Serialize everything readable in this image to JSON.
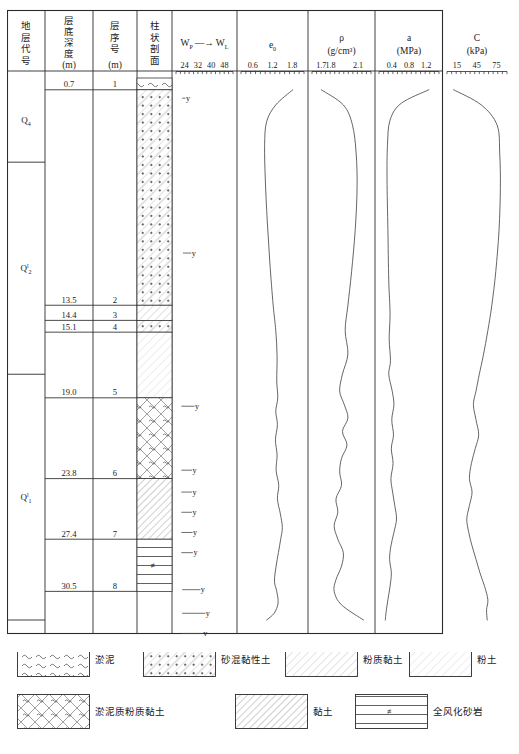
{
  "columns": {
    "strat_code": {
      "header_lines": [
        "地",
        "层",
        "代",
        "号"
      ]
    },
    "layer_depth": {
      "header_lines": [
        "层",
        "底",
        "深",
        "度"
      ],
      "unit": "(m)"
    },
    "layer_no": {
      "header_lines": [
        "层",
        "序",
        "号"
      ],
      "unit": "(m)"
    },
    "profile": {
      "header_lines": [
        "柱",
        "状",
        "剖",
        "面"
      ]
    },
    "wp_wl": {
      "symbol_left": "W",
      "sub_left": "P",
      "symbol_right": "W",
      "sub_right": "L",
      "ticks": [
        "24",
        "32",
        "40",
        "48"
      ],
      "tick_values": [
        24,
        32,
        40,
        48
      ]
    },
    "e0": {
      "symbol": "e",
      "sub": "0",
      "ticks": [
        "0.6",
        "1.2",
        "1.8"
      ],
      "tick_values": [
        0.6,
        1.2,
        1.8
      ]
    },
    "rho": {
      "symbol": "ρ",
      "unit": "(g/cm³)",
      "ticks": [
        "1.7",
        "1.8",
        "2.1"
      ],
      "tick_values": [
        1.7,
        1.8,
        2.1
      ]
    },
    "a": {
      "symbol": "a",
      "unit": "(MPa)",
      "ticks": [
        "0.4",
        "0.8",
        "1.2"
      ],
      "tick_values": [
        0.4,
        0.8,
        1.2
      ]
    },
    "C": {
      "symbol": "C",
      "unit": "(kPa)",
      "ticks": [
        "15",
        "45",
        "75"
      ],
      "tick_values": [
        15,
        45,
        75
      ]
    }
  },
  "strat_groups": [
    {
      "code": "Q",
      "sub": "4",
      "sup": "",
      "depth_top": 0.0,
      "depth_bottom": 5.0
    },
    {
      "code": "Q",
      "sub": "2",
      "sup": "l",
      "depth_top": 5.0,
      "depth_bottom": 17.6
    },
    {
      "code": "Q",
      "sub": "1",
      "sup": "l",
      "depth_top": 17.6,
      "depth_bottom": 32.2
    }
  ],
  "layers": [
    {
      "no": "1",
      "depth_bottom": "0.7",
      "depth_value": 0.7,
      "pattern": "mud"
    },
    {
      "no": "2",
      "depth_bottom": "13.5",
      "depth_value": 13.5,
      "pattern": "sand-clay"
    },
    {
      "no": "3",
      "depth_bottom": "14.4",
      "depth_value": 14.4,
      "pattern": "silty-clay"
    },
    {
      "no": "4",
      "depth_bottom": "15.1",
      "depth_value": 15.1,
      "pattern": "sand-clay"
    },
    {
      "no": "5",
      "depth_bottom": "19.0",
      "depth_value": 19.0,
      "pattern": "silt"
    },
    {
      "no": "6",
      "depth_bottom": "23.8",
      "depth_value": 23.8,
      "pattern": "muddy-silty-clay"
    },
    {
      "no": "7",
      "depth_bottom": "27.4",
      "depth_value": 27.4,
      "pattern": "clay"
    },
    {
      "no": "8",
      "depth_bottom": "30.5",
      "depth_value": 30.5,
      "pattern": "weathered-sandstone"
    }
  ],
  "chart_data": {
    "type": "line",
    "ylabel": "深度 (m)",
    "ylim": [
      0,
      32.2
    ],
    "grid": false,
    "legend": "none",
    "panels": [
      {
        "name": "wp_wl",
        "label": "W_P — W_L",
        "type": "range-bar",
        "xlim": [
          20,
          52
        ],
        "xticks": [
          24,
          32,
          40,
          48
        ],
        "points": [
          {
            "depth": 1.2,
            "wp": 22.5,
            "wl": 24.5
          },
          {
            "depth": 10.4,
            "wp": 23.0,
            "wl": 28.0
          },
          {
            "depth": 19.5,
            "wp": 22.0,
            "wl": 30.0
          },
          {
            "depth": 23.3,
            "wp": 22.0,
            "wl": 28.5
          },
          {
            "depth": 24.6,
            "wp": 22.0,
            "wl": 28.5
          },
          {
            "depth": 25.8,
            "wp": 22.0,
            "wl": 28.5
          },
          {
            "depth": 27.0,
            "wp": 22.0,
            "wl": 28.8
          },
          {
            "depth": 28.2,
            "wp": 22.0,
            "wl": 29.0
          },
          {
            "depth": 30.4,
            "wp": 22.5,
            "wl": 33.5
          },
          {
            "depth": 31.8,
            "wp": 22.5,
            "wl": 36.5
          },
          {
            "depth": 33.0,
            "wp": 22.5,
            "wl": 35.0
          },
          {
            "depth": 34.4,
            "wp": 22.5,
            "wl": 39.0
          },
          {
            "depth": 35.6,
            "wp": 23.5,
            "wl": 37.5
          },
          {
            "depth": 37.4,
            "wp": 25.5,
            "wl": 33.5
          },
          {
            "depth": 38.6,
            "wp": 21.5,
            "wl": 29.0
          },
          {
            "depth": 39.9,
            "wp": 26.0,
            "wl": 34.0
          },
          {
            "depth": 42.0,
            "wp": 20.5,
            "wl": 23.0
          }
        ]
      },
      {
        "name": "e0",
        "label": "e₀",
        "type": "line",
        "xlim": [
          0.3,
          2.1
        ],
        "xticks": [
          0.6,
          1.2,
          1.8
        ],
        "values": [
          {
            "depth": 0.7,
            "v": 1.82
          },
          {
            "depth": 1.6,
            "v": 1.3
          },
          {
            "depth": 2.6,
            "v": 1.02
          },
          {
            "depth": 4.0,
            "v": 0.96
          },
          {
            "depth": 6.0,
            "v": 0.98
          },
          {
            "depth": 8.5,
            "v": 1.04
          },
          {
            "depth": 11.0,
            "v": 1.12
          },
          {
            "depth": 13.5,
            "v": 1.22
          },
          {
            "depth": 15.0,
            "v": 1.3
          },
          {
            "depth": 16.5,
            "v": 1.34
          },
          {
            "depth": 18.0,
            "v": 1.33
          },
          {
            "depth": 19.0,
            "v": 1.36
          },
          {
            "depth": 19.8,
            "v": 1.3
          },
          {
            "depth": 20.6,
            "v": 1.35
          },
          {
            "depth": 21.5,
            "v": 1.29
          },
          {
            "depth": 22.4,
            "v": 1.34
          },
          {
            "depth": 23.3,
            "v": 1.31
          },
          {
            "depth": 24.2,
            "v": 1.39
          },
          {
            "depth": 25.0,
            "v": 1.35
          },
          {
            "depth": 25.9,
            "v": 1.44
          },
          {
            "depth": 26.7,
            "v": 1.5
          },
          {
            "depth": 27.4,
            "v": 1.45
          },
          {
            "depth": 28.2,
            "v": 1.38
          },
          {
            "depth": 29.0,
            "v": 1.31
          },
          {
            "depth": 29.9,
            "v": 1.26
          },
          {
            "depth": 30.5,
            "v": 1.33
          },
          {
            "depth": 31.2,
            "v": 1.37
          },
          {
            "depth": 31.8,
            "v": 1.25
          },
          {
            "depth": 32.2,
            "v": 1.02
          }
        ]
      },
      {
        "name": "rho",
        "label": "ρ (g/cm³)",
        "type": "line",
        "xlim": [
          1.62,
          2.22
        ],
        "xticks": [
          1.7,
          1.8,
          2.1
        ],
        "values": [
          {
            "depth": 0.7,
            "v": 1.7
          },
          {
            "depth": 1.6,
            "v": 1.94
          },
          {
            "depth": 2.8,
            "v": 2.04
          },
          {
            "depth": 4.5,
            "v": 2.08
          },
          {
            "depth": 6.5,
            "v": 2.09
          },
          {
            "depth": 9.0,
            "v": 2.07
          },
          {
            "depth": 11.5,
            "v": 2.03
          },
          {
            "depth": 13.5,
            "v": 1.99
          },
          {
            "depth": 15.0,
            "v": 1.96
          },
          {
            "depth": 16.4,
            "v": 1.99
          },
          {
            "depth": 17.6,
            "v": 1.93
          },
          {
            "depth": 18.6,
            "v": 1.9
          },
          {
            "depth": 19.4,
            "v": 1.95
          },
          {
            "depth": 20.2,
            "v": 1.99
          },
          {
            "depth": 21.0,
            "v": 1.93
          },
          {
            "depth": 21.8,
            "v": 1.98
          },
          {
            "depth": 22.6,
            "v": 1.92
          },
          {
            "depth": 23.4,
            "v": 1.9
          },
          {
            "depth": 24.2,
            "v": 1.92
          },
          {
            "depth": 25.0,
            "v": 1.86
          },
          {
            "depth": 25.8,
            "v": 1.88
          },
          {
            "depth": 26.6,
            "v": 1.84
          },
          {
            "depth": 27.4,
            "v": 1.88
          },
          {
            "depth": 28.2,
            "v": 1.94
          },
          {
            "depth": 29.0,
            "v": 1.92
          },
          {
            "depth": 29.8,
            "v": 1.86
          },
          {
            "depth": 30.5,
            "v": 1.84
          },
          {
            "depth": 31.3,
            "v": 1.92
          },
          {
            "depth": 32.2,
            "v": 2.16
          }
        ]
      },
      {
        "name": "a",
        "label": "a (MPa)",
        "type": "line",
        "xlim": [
          0.15,
          1.45
        ],
        "xticks": [
          0.4,
          0.8,
          1.2
        ],
        "values": [
          {
            "depth": 0.7,
            "v": 1.26
          },
          {
            "depth": 1.5,
            "v": 0.62
          },
          {
            "depth": 2.5,
            "v": 0.36
          },
          {
            "depth": 4.0,
            "v": 0.3
          },
          {
            "depth": 6.0,
            "v": 0.29
          },
          {
            "depth": 9.0,
            "v": 0.31
          },
          {
            "depth": 12.0,
            "v": 0.33
          },
          {
            "depth": 14.0,
            "v": 0.36
          },
          {
            "depth": 15.5,
            "v": 0.34
          },
          {
            "depth": 16.8,
            "v": 0.37
          },
          {
            "depth": 17.6,
            "v": 0.33
          },
          {
            "depth": 18.6,
            "v": 0.41
          },
          {
            "depth": 19.4,
            "v": 0.45
          },
          {
            "depth": 20.3,
            "v": 0.4
          },
          {
            "depth": 21.2,
            "v": 0.44
          },
          {
            "depth": 22.0,
            "v": 0.39
          },
          {
            "depth": 22.9,
            "v": 0.43
          },
          {
            "depth": 23.8,
            "v": 0.38
          },
          {
            "depth": 24.6,
            "v": 0.42
          },
          {
            "depth": 25.4,
            "v": 0.47
          },
          {
            "depth": 26.2,
            "v": 0.51
          },
          {
            "depth": 27.0,
            "v": 0.45
          },
          {
            "depth": 27.8,
            "v": 0.38
          },
          {
            "depth": 28.6,
            "v": 0.35
          },
          {
            "depth": 29.4,
            "v": 0.39
          },
          {
            "depth": 30.2,
            "v": 0.36
          },
          {
            "depth": 31.0,
            "v": 0.31
          },
          {
            "depth": 31.7,
            "v": 0.27
          },
          {
            "depth": 32.2,
            "v": 0.25
          }
        ]
      },
      {
        "name": "C",
        "label": "C (kPa)",
        "type": "line",
        "xlim": [
          3,
          88
        ],
        "xticks": [
          15,
          45,
          75
        ],
        "values": [
          {
            "depth": 0.7,
            "v": 10
          },
          {
            "depth": 1.6,
            "v": 52
          },
          {
            "depth": 2.8,
            "v": 76
          },
          {
            "depth": 4.5,
            "v": 80
          },
          {
            "depth": 6.5,
            "v": 81
          },
          {
            "depth": 9.0,
            "v": 79
          },
          {
            "depth": 11.5,
            "v": 74
          },
          {
            "depth": 13.5,
            "v": 68
          },
          {
            "depth": 15.0,
            "v": 62
          },
          {
            "depth": 16.5,
            "v": 55
          },
          {
            "depth": 17.6,
            "v": 49
          },
          {
            "depth": 18.6,
            "v": 44
          },
          {
            "depth": 19.4,
            "v": 40
          },
          {
            "depth": 20.3,
            "v": 44
          },
          {
            "depth": 21.2,
            "v": 48
          },
          {
            "depth": 22.0,
            "v": 43
          },
          {
            "depth": 22.9,
            "v": 37
          },
          {
            "depth": 23.8,
            "v": 34
          },
          {
            "depth": 24.6,
            "v": 38
          },
          {
            "depth": 25.4,
            "v": 34
          },
          {
            "depth": 26.2,
            "v": 30
          },
          {
            "depth": 27.0,
            "v": 33
          },
          {
            "depth": 27.8,
            "v": 38
          },
          {
            "depth": 28.6,
            "v": 44
          },
          {
            "depth": 29.4,
            "v": 50
          },
          {
            "depth": 30.2,
            "v": 57
          },
          {
            "depth": 31.0,
            "v": 62
          },
          {
            "depth": 31.6,
            "v": 60
          },
          {
            "depth": 32.2,
            "v": 61
          }
        ]
      }
    ]
  },
  "legend": {
    "items": [
      {
        "pattern": "mud",
        "label": "淤泥"
      },
      {
        "pattern": "sand-clay",
        "label": "砂混黏性土"
      },
      {
        "pattern": "silty-clay",
        "label": "粉质黏土"
      },
      {
        "pattern": "silt",
        "label": "粉土"
      },
      {
        "pattern": "muddy-silty-clay",
        "label": "淤泥质粉质黏土"
      },
      {
        "pattern": "clay",
        "label": "黏土"
      },
      {
        "pattern": "weathered-sandstone",
        "label": "全风化砂岩"
      }
    ]
  },
  "colors": {
    "line": "#4a4a4a",
    "border": "#2b2b2b",
    "hatch": "#8a8a8a",
    "text": "#1a1a1a"
  }
}
